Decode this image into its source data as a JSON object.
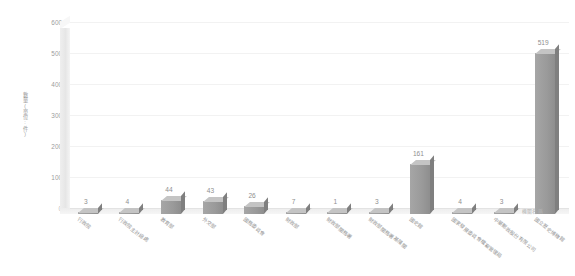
{
  "chart_data": {
    "type": "bar",
    "title": "",
    "xlabel": "機關名稱",
    "ylabel": "數量(單位:件)",
    "ylim": [
      0,
      600
    ],
    "yticks": [
      0,
      100,
      200,
      300,
      400,
      500,
      600
    ],
    "grid": true,
    "legend": false,
    "categories": [
      "行政院",
      "行政院主計總處",
      "教育部",
      "外交部",
      "國務委員會",
      "財政部",
      "財政部關務署",
      "財政部關務署基隆關",
      "國史館",
      "國家發展委員會檔案管理局",
      "中華郵政股份有限公司",
      "國立歷史博物館"
    ],
    "values": [
      3,
      4,
      44,
      43,
      26,
      7,
      1,
      3,
      161,
      4,
      3,
      519
    ],
    "bar_color": "#9a9a9a",
    "bar_top_color": "#c4c4c4",
    "bar_side_color": "#7f7f7f"
  },
  "axis": {
    "y_title": "數量(單位:件)",
    "x_title": "機關名稱",
    "tick_labels": [
      "600",
      "500",
      "400",
      "300",
      "200",
      "100",
      "0"
    ]
  }
}
